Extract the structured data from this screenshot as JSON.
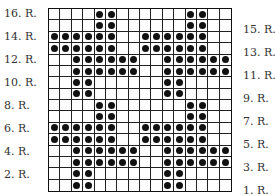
{
  "chart": {
    "columns": 16,
    "rows": 16,
    "row_labels_left": [
      "16. R.",
      "14. R.",
      "12. R.",
      "10. R.",
      "8. R.",
      "6. R.",
      "4. R.",
      "2. R."
    ],
    "row_labels_right": [
      "15. R.",
      "13. R.",
      "11. R.",
      "9. R.",
      "7. R.",
      "5. R.",
      "3. R.",
      "1. R."
    ],
    "pattern_top_to_bottom": [
      "....XX......XX..",
      "....XX......XX..",
      "XXXXXX..XXXXXX..",
      "XXXXXX..XXXXXX..",
      "..XXXXXX..XXXXXX",
      "..XXXXXX..XXXXXX",
      "..XX......XX....",
      "..XX......XX....",
      "....XX......XX..",
      "....XX......XX..",
      "XXXXXX..XXXXXX..",
      "XXXXXX..XXXXXX..",
      "..XXXXXX..XXXXXX",
      "..XXXXXX..XXXXXX",
      "..XX......XX....",
      "..XX......XX...."
    ],
    "filled_symbol": "dot-icon",
    "colors": {
      "dot": "#111111",
      "grid_line": "#222222",
      "label": "#333333"
    }
  }
}
